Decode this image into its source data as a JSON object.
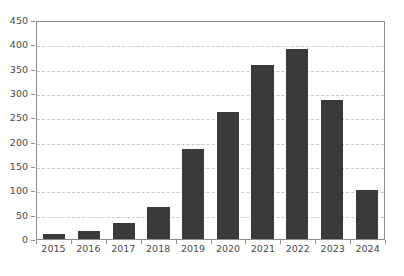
{
  "chart_data": {
    "type": "bar",
    "title": "",
    "subtitle": "",
    "xlabel": "",
    "ylabel": "",
    "categories": [
      "2015",
      "2016",
      "2017",
      "2018",
      "2019",
      "2020",
      "2021",
      "2022",
      "2023",
      "2024"
    ],
    "values": [
      10,
      17,
      32,
      66,
      185,
      260,
      358,
      390,
      285,
      100
    ],
    "ylim": [
      0,
      450
    ],
    "yticks": [
      0,
      50,
      100,
      150,
      200,
      250,
      300,
      350,
      400,
      450
    ],
    "ytick_labels": [
      "0",
      "50",
      "100",
      "150",
      "200",
      "250",
      "300",
      "350",
      "400",
      "450"
    ],
    "grid": true,
    "grid_axis": "y",
    "grid_style": "dashed",
    "legend": false,
    "legend_position": "none",
    "series": [
      {
        "name": "",
        "values": [
          10,
          17,
          32,
          66,
          185,
          260,
          358,
          390,
          285,
          100
        ]
      }
    ]
  },
  "style": {
    "bar_color": "#3a3a3a",
    "grid_color": "#c8c8c8",
    "axis_color": "#8c8c8c",
    "tick_label_color": "#4a4a4a",
    "background": "#ffffff"
  }
}
